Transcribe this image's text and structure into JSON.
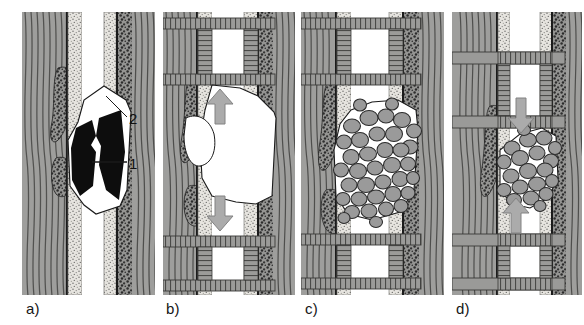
{
  "figure": {
    "width": 584,
    "height": 325,
    "background": "#ffffff"
  },
  "palette": {
    "host_rock_gray": "#9d9d9d",
    "host_rock_line": "#4a4a4a",
    "sandstone_light": "#e3e1dc",
    "sandstone_stipple": "#6a6a6a",
    "conglomerate_gray": "#8f8f8f",
    "conglomerate_dot": "#2f2f2f",
    "ore_black": "#0d0d0d",
    "void_white": "#ffffff",
    "timber_gray": "#9a9a9a",
    "timber_outline": "#3a3a3a",
    "rubble_block": "#9a9a9a",
    "rubble_outline": "#2b2b2b",
    "arrow_gray": "#a8a8a8",
    "arrow_outline": "#7c7c7c",
    "label_black": "#161616"
  },
  "panels": [
    {
      "id": "a",
      "label": "a)",
      "label_x": 26,
      "label_y": 300,
      "x": 22,
      "y": 12,
      "width": 133,
      "height": 283,
      "description": "Undisturbed vein with two black ore bodies exposed in an open stope void",
      "has_timbering": false,
      "has_rubble": false,
      "arrows": []
    },
    {
      "id": "b",
      "label": "b)",
      "label_x": 166,
      "label_y": 300,
      "x": 163,
      "y": 12,
      "width": 132,
      "height": 283,
      "description": "Timbered levels above and below; ore removed leaving a large open void",
      "has_timbering": true,
      "has_rubble": false,
      "arrows": [
        {
          "name": "up-arrow",
          "direction": "up",
          "x": 215,
          "y": 110
        },
        {
          "name": "down-arrow",
          "direction": "down",
          "x": 215,
          "y": 215
        }
      ]
    },
    {
      "id": "c",
      "label": "c)",
      "label_x": 305,
      "label_y": 300,
      "x": 301,
      "y": 12,
      "width": 143,
      "height": 283,
      "description": "Void partly filled by caved rock rubble between the timbered levels",
      "has_timbering": true,
      "has_rubble": true,
      "arrows": []
    },
    {
      "id": "d",
      "label": "d)",
      "label_x": 456,
      "label_y": 300,
      "x": 452,
      "y": 12,
      "width": 130,
      "height": 283,
      "description": "Compacted rubble column with convergence arrows and protruding drift supports",
      "has_timbering": true,
      "has_rubble": true,
      "arrows": [
        {
          "name": "down-arrow",
          "direction": "down",
          "x": 514,
          "y": 113
        },
        {
          "name": "up-arrow",
          "direction": "up",
          "x": 507,
          "y": 215
        }
      ]
    }
  ],
  "callouts": [
    {
      "id": "callout-2",
      "text": "2",
      "text_x": 131,
      "text_y": 120,
      "leader_from_x": 127,
      "leader_from_y": 117,
      "leader_to_x": 106,
      "leader_to_y": 96,
      "meaning": "open void / worked-out space"
    },
    {
      "id": "callout-1",
      "text": "1",
      "text_x": 131,
      "text_y": 165,
      "leader_from_x": 127,
      "leader_from_y": 162,
      "leader_to_x": 92,
      "leader_to_y": 162,
      "meaning": "ore body"
    }
  ],
  "legend_keys": {
    "ore_body": "1",
    "void": "2"
  }
}
